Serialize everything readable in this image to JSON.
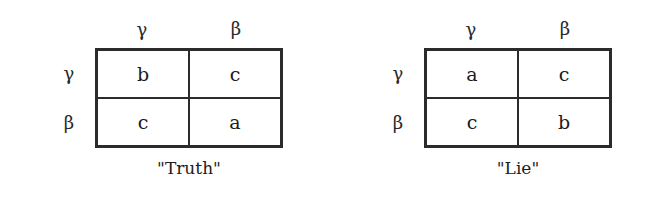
{
  "figure": {
    "background_color": "#ffffff",
    "ink_color": "#1c1c1c",
    "border_color": "#2b2b2b"
  },
  "matrices": [
    {
      "id": "truth",
      "caption": "\"Truth\"",
      "column_headers": [
        "γ",
        "β"
      ],
      "row_headers": [
        "γ",
        "β"
      ],
      "cells": [
        [
          "b",
          "c"
        ],
        [
          "c",
          "a"
        ]
      ]
    },
    {
      "id": "lie",
      "caption": "\"Lie\"",
      "column_headers": [
        "γ",
        "β"
      ],
      "row_headers": [
        "γ",
        "β"
      ],
      "cells": [
        [
          "a",
          "c"
        ],
        [
          "c",
          "b"
        ]
      ]
    }
  ]
}
